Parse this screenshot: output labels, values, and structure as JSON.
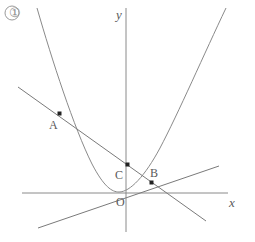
{
  "figure": {
    "title_marker": "①",
    "background_color": "#ffffff",
    "curve_color": "#8a8a8a",
    "axis_color": "#8a8a8a",
    "line_color": "#7a7a7a",
    "label_color": "#5a5a5a",
    "point_color": "#222222",
    "axes": {
      "x_label": "x",
      "y_label": "y",
      "origin_label": "O",
      "x_axis": {
        "x1": 22,
        "y1": 193,
        "x2": 228,
        "y2": 193
      },
      "y_axis": {
        "x1": 126,
        "y1": 8,
        "x2": 126,
        "y2": 232
      },
      "origin": {
        "x": 126,
        "y": 193
      }
    },
    "points": [
      {
        "name": "A",
        "x": 60,
        "y": 114,
        "label": "A",
        "label_x": 49,
        "label_y": 119
      },
      {
        "name": "C",
        "x": 128,
        "y": 165,
        "label": "C",
        "label_x": 115,
        "label_y": 169
      },
      {
        "name": "B",
        "x": 152,
        "y": 183,
        "label": "B",
        "label_x": 150,
        "label_y": 168
      }
    ],
    "parabola": {
      "description": "upward-opening parabola through A and B with vertex near origin",
      "vertex": {
        "x": 117,
        "y": 192
      },
      "path": "M 37,8 C 52,60 74,128 92,164 C 104,187 112,192 119,192 C 130,192 145,176 160,148 C 178,114 205,52 226,8"
    },
    "lines": [
      {
        "name": "line-AB",
        "description": "secant line through A, C and B",
        "x1": 18,
        "y1": 87,
        "x2": 206,
        "y2": 221
      },
      {
        "name": "line-through-B",
        "description": "shallow line rising to the right through B",
        "x1": 38,
        "y1": 228,
        "x2": 219,
        "y2": 166
      }
    ],
    "axis_label_positions": {
      "x_label_x": 229,
      "x_label_y": 197,
      "y_label_x": 116,
      "y_label_y": 8,
      "origin_label_x": 117,
      "origin_label_y": 196,
      "marker_x": 6,
      "marker_y": 7
    }
  }
}
